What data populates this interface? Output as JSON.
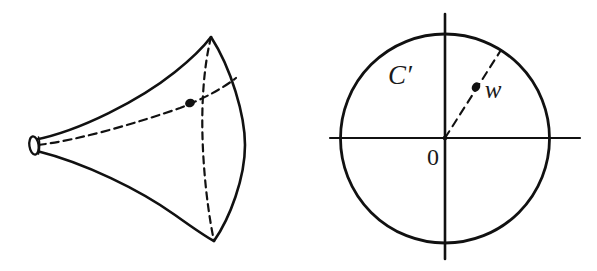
{
  "figure": {
    "background_color": "#ffffff",
    "ink_color": "#111111",
    "panels": [
      {
        "name": "pseudosphere-panel",
        "description": "pseudosphere / horn surface with marked point",
        "elements": {
          "tip_opening": "small ellipse at narrow end",
          "upper_silhouette": "solid concave curve from tip to upper rim",
          "lower_silhouette": "solid concave curve from tip to lower rim",
          "rim_front": "solid lens arc bulging right",
          "rim_back": "dashed lens arc (hidden edge)",
          "meridian_dashed": "dashed curve from tip to rim passing through marked point",
          "marked_point": "filled dot on surface"
        }
      },
      {
        "name": "unit-disk-panel",
        "description": "unit disk with axes, boundary circle C' and interior point w",
        "labels": {
          "circle": "C′",
          "origin": "0",
          "point": "w"
        },
        "elements": {
          "horizontal_axis": "solid line through origin",
          "vertical_axis": "solid line through origin",
          "boundary_circle": "solid circle",
          "radius_dashed": "dashed segment from origin to boundary through w",
          "marked_point": "filled dot at w"
        }
      }
    ]
  }
}
